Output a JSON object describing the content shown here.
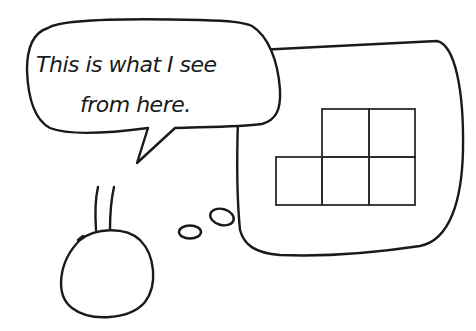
{
  "illustration": {
    "speech_bubble": {
      "lines": [
        "This is what I see",
        "from here."
      ]
    },
    "thought_bubble": {
      "content": "grid-shape",
      "grid": {
        "rows": [
          {
            "cells": 2,
            "offset": 1
          },
          {
            "cells": 3,
            "offset": 0
          }
        ]
      }
    },
    "character": "stick-figure-head-with-neck",
    "thought_dots": 2,
    "colors": {
      "ink": "#1a1a1a",
      "background": "#ffffff"
    }
  }
}
